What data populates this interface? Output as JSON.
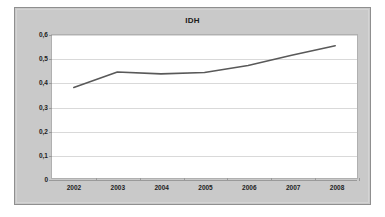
{
  "chart_data": {
    "type": "line",
    "title": "IDH",
    "xlabel": "",
    "ylabel": "",
    "categories": [
      "2002",
      "2003",
      "2004",
      "2005",
      "2006",
      "2007",
      "2008"
    ],
    "values": [
      0.38,
      0.445,
      0.437,
      0.443,
      0.472,
      0.515,
      0.555
    ],
    "series": [
      {
        "name": "IDH",
        "values": [
          0.38,
          0.445,
          0.437,
          0.443,
          0.472,
          0.515,
          0.555
        ]
      }
    ],
    "ylim": [
      0,
      0.6
    ],
    "ytick_values": [
      0.6,
      0.5,
      0.4,
      0.3,
      0.2,
      0.1,
      0
    ],
    "ytick_labels": [
      "0,6",
      "0,5",
      "0,4",
      "0,3",
      "0,2",
      "0,1",
      "0"
    ],
    "xtick_labels": [
      "2002",
      "2003",
      "2004",
      "2005",
      "2006",
      "2007",
      "2008"
    ],
    "grid": true,
    "legend": "none",
    "decimal_separator": ",",
    "colors": {
      "series_line": "#595959",
      "plot_background": "#ffffff",
      "chart_background": "#c9c9c9",
      "gridline": "#d9d9d9",
      "axis": "#9a9a9a",
      "text": "#222222"
    }
  }
}
